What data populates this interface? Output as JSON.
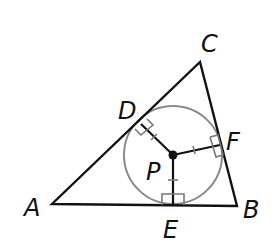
{
  "diagram": {
    "type": "triangle-incircle",
    "vertices": {
      "A": {
        "label": "A",
        "x": 52,
        "y": 204
      },
      "B": {
        "label": "B",
        "x": 237,
        "y": 206
      },
      "C": {
        "label": "C",
        "x": 200,
        "y": 62
      }
    },
    "center": {
      "label": "P",
      "x": 173,
      "y": 155
    },
    "tangent_points": {
      "D": {
        "label": "D",
        "x": 141,
        "y": 124
      },
      "E": {
        "label": "E",
        "x": 173,
        "y": 205
      },
      "F": {
        "label": "F",
        "x": 220,
        "y": 145
      }
    },
    "circle_radius": 49,
    "colors": {
      "lines": "#111111",
      "circle": "#888888",
      "right_angle_marks": "#777777"
    }
  }
}
